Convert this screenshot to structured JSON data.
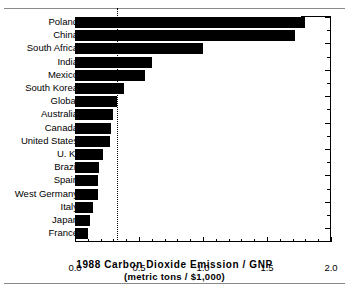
{
  "chart_data": {
    "type": "bar",
    "orientation": "horizontal",
    "title": "",
    "xlabel": "1988 Carbon Dioxide Emission / GNP",
    "xlabel_sub": "(metric tons / $1,000)",
    "ylabel": "",
    "xlim": [
      0.0,
      2.0
    ],
    "grid": false,
    "legend": null,
    "xticks": [
      0.0,
      0.5,
      1.0,
      1.5,
      2.0
    ],
    "xticklabels": [
      "0.0",
      "0.5",
      "1.0",
      "1.5",
      "2.0"
    ],
    "xtick_minor_step": 0.1,
    "annotations": [
      {
        "name": "global-average-reference-line",
        "style": "dotted-vertical",
        "value": 0.33
      }
    ],
    "categories": [
      "Poland",
      "China",
      "South Africa",
      "India",
      "Mexico",
      "South Korea",
      "Global",
      "Australia",
      "Canada",
      "United States",
      "U. K.",
      "Brazil",
      "Spain",
      "West Germany",
      "Italy",
      "Japan",
      "France"
    ],
    "values": [
      1.8,
      1.72,
      1.0,
      0.6,
      0.55,
      0.38,
      0.33,
      0.3,
      0.28,
      0.27,
      0.22,
      0.19,
      0.18,
      0.18,
      0.14,
      0.12,
      0.1
    ]
  }
}
